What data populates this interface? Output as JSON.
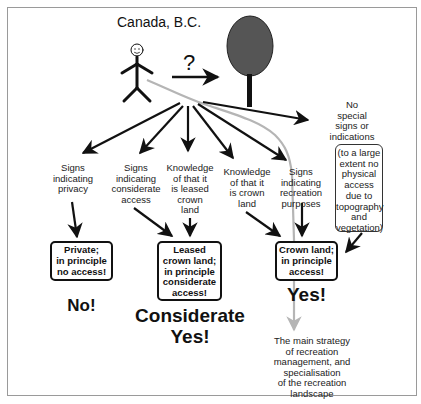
{
  "title": "Canada, B.C.",
  "question_mark": "?",
  "actor": {
    "icon": "stick-figure-icon"
  },
  "target": {
    "icon": "tree-icon",
    "fill": "#555555"
  },
  "branches": [
    {
      "id": "privacy",
      "label": "Signs indicating privacy"
    },
    {
      "id": "considerate",
      "label": "Signs indicating considerate access"
    },
    {
      "id": "leased",
      "label": "Knowledge of that it is leased crown land"
    },
    {
      "id": "crown",
      "label": "Knowledge of that it is crown land"
    },
    {
      "id": "recreation",
      "label": "Signs indicating recreation purposes"
    },
    {
      "id": "nosigns",
      "label": "No special signs or indications"
    }
  ],
  "labels": {
    "privacy": [
      "Signs",
      "indicating",
      "privacy"
    ],
    "considerate": [
      "Signs",
      "indicating",
      "considerate",
      "access"
    ],
    "leased": [
      "Knowledge",
      "of that it",
      "is leased",
      "crown",
      "land"
    ],
    "crown": [
      "Knowledge",
      "of that it",
      "is crown",
      "land"
    ],
    "recreation": [
      "Signs",
      "indicating",
      "recreation",
      "purposes"
    ],
    "nosigns": [
      "No",
      "special",
      "signs or",
      "indications"
    ],
    "no_access_note": [
      "(to a large",
      "extent no",
      "physical",
      "access",
      "due to",
      "topography",
      "and",
      "vegetation)"
    ]
  },
  "outcomes": {
    "private": {
      "lines": [
        "Private;",
        "in principle",
        "no access!"
      ],
      "verdict": "No!"
    },
    "leased": {
      "lines": [
        "Leased",
        "crown land;",
        "in principle",
        "considerate",
        "access!"
      ],
      "verdict_line1": "Considerate",
      "verdict_line2": "Yes!"
    },
    "crown": {
      "lines": [
        "Crown land;",
        "in principle",
        "access!"
      ],
      "verdict": "Yes!"
    }
  },
  "strategy": [
    "The main strategy",
    "of recreation",
    "management, and",
    "specialisation",
    "of the recreation",
    "landscape"
  ],
  "colors": {
    "line": "#111111",
    "highlight_path": "#b5b5b5",
    "frame": "#9a9a9a"
  }
}
